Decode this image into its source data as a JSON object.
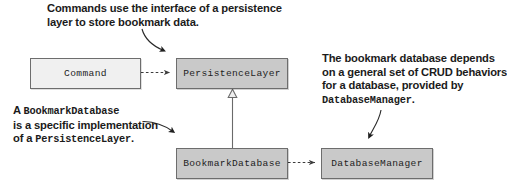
{
  "diagram": {
    "background_color": "#ffffff",
    "text_color": "#1b1b1b",
    "box_light_fill": "#f0f0f0",
    "box_shaded_fill": "#c9c9c9",
    "box_border_color": "#6d6d6d",
    "connector_color": "#4a4a4a"
  },
  "notes": {
    "top": {
      "line1": "Commands use the interface of a persistence",
      "line2": "layer to store bookmark data."
    },
    "left": {
      "line1_prefix": "A ",
      "line1_mono": "BookmarkDatabase",
      "line2": "is a specific implementation",
      "line3_prefix": "of a ",
      "line3_mono": "PersistenceLayer",
      "line3_suffix": "."
    },
    "right": {
      "line1": "The bookmark database depends",
      "line2": "on a general set of CRUD behaviors",
      "line3": "for a database, provided by",
      "line4_mono": "DatabaseManager",
      "line4_suffix": "."
    }
  },
  "classes": [
    {
      "id": "command",
      "label": "Command",
      "fill": "light"
    },
    {
      "id": "persistence_layer",
      "label": "PersistenceLayer",
      "fill": "shaded"
    },
    {
      "id": "bookmark_database",
      "label": "BookmarkDatabase",
      "fill": "shaded"
    },
    {
      "id": "database_manager",
      "label": "DatabaseManager",
      "fill": "shaded"
    }
  ],
  "relationships": [
    {
      "id": "command-uses-persistencelayer",
      "from": "Command",
      "to": "PersistenceLayer",
      "type": "dependency",
      "line": "dashed",
      "arrowhead": "open-filled"
    },
    {
      "id": "bookmarkdatabase-implements-persistencelayer",
      "from": "BookmarkDatabase",
      "to": "PersistenceLayer",
      "type": "realization",
      "line": "solid",
      "arrowhead": "hollow-triangle"
    },
    {
      "id": "bookmarkdatabase-uses-databasemanager",
      "from": "BookmarkDatabase",
      "to": "DatabaseManager",
      "type": "dependency",
      "line": "dashed",
      "arrowhead": "open-filled"
    }
  ],
  "callouts": [
    {
      "id": "callout-top",
      "from_note": "top",
      "points_to": "PersistenceLayer"
    },
    {
      "id": "callout-left",
      "from_note": "left",
      "points_to": "BookmarkDatabase"
    },
    {
      "id": "callout-right",
      "from_note": "right",
      "points_to": "DatabaseManager"
    }
  ]
}
